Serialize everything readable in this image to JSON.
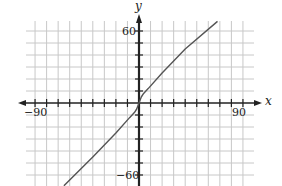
{
  "chart_data": {
    "type": "line",
    "title": "",
    "xlabel": "x",
    "ylabel": "y",
    "xlim": [
      -90,
      90
    ],
    "ylim": [
      -60,
      60
    ],
    "x_tick_step": 10,
    "y_tick_step": 10,
    "x_tick_labels": [
      "-90",
      "90"
    ],
    "y_tick_labels": [
      "60",
      "-60"
    ],
    "grid": true,
    "legend": null,
    "series": [
      {
        "name": "curve",
        "color": "#555555",
        "x": [
          -65,
          -40,
          -20,
          -8,
          -4,
          -2,
          0,
          2,
          4,
          8,
          20,
          40,
          68
        ],
        "y": [
          -69,
          -45,
          -25,
          -12,
          -8,
          -5,
          0,
          5,
          8,
          12,
          25,
          45,
          68
        ]
      }
    ]
  },
  "labels": {
    "x_axis": "x",
    "y_axis": "y",
    "x_min": "−90",
    "x_max": "90",
    "y_max": "60",
    "y_min": "−60"
  },
  "colors": {
    "grid": "#c8c8c8",
    "axis": "#222222",
    "curve": "#555555"
  }
}
